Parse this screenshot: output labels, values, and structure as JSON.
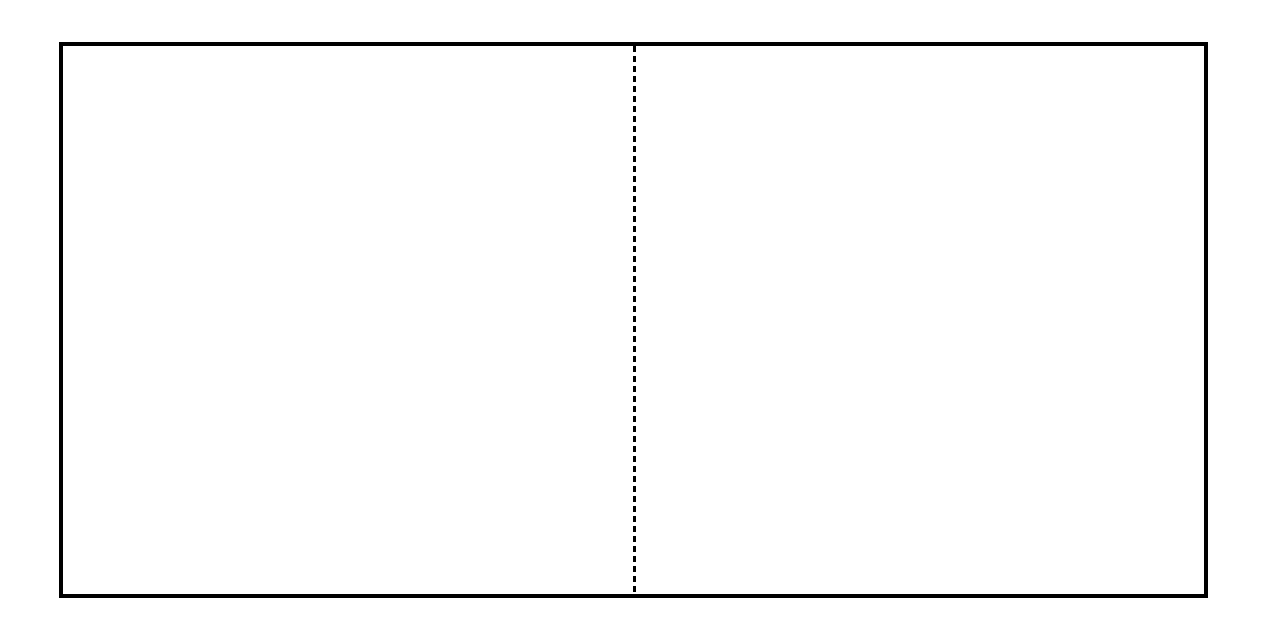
{
  "diagram": {
    "shape": "rectangle",
    "border_color": "#000000",
    "fill_color": "#ffffff",
    "divider": {
      "orientation": "vertical",
      "style": "dashed",
      "color": "#000000"
    },
    "panels": [
      {
        "name": "left-half",
        "label": ""
      },
      {
        "name": "right-half",
        "label": ""
      }
    ]
  }
}
